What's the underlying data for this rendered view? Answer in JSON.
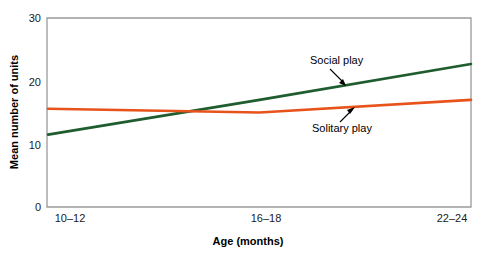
{
  "chart_data": {
    "type": "line",
    "title": "",
    "xlabel": "Age (months)",
    "ylabel": "Mean number of units",
    "categories": [
      "10–12",
      "16–18",
      "22–24"
    ],
    "x_tick_labels": [
      "10–12",
      "16–18",
      "22–24"
    ],
    "y_tick_labels": [
      "0",
      "10",
      "20",
      "30"
    ],
    "y_ticks": [
      0,
      10,
      20,
      30
    ],
    "ylim": [
      0,
      30
    ],
    "xlim": [
      0,
      2
    ],
    "grid": false,
    "legend": "annotations-on-plot",
    "series": [
      {
        "name": "Social play",
        "color": "#1F5C2E",
        "x": [
          "10–12",
          "16–18",
          "22–24"
        ],
        "values": [
          11.5,
          17.0,
          22.7
        ]
      },
      {
        "name": "Solitary play",
        "color": "#E8531B",
        "x": [
          "10–12",
          "16–18",
          "22–24"
        ],
        "values": [
          15.6,
          15.0,
          17.0
        ]
      }
    ],
    "annotations": [
      {
        "text": "Social play",
        "series": "Social play"
      },
      {
        "text": "Solitary play",
        "series": "Solitary play"
      }
    ]
  },
  "colors": {
    "social_play": "#1F5C2E",
    "solitary_play": "#E8531B",
    "axis": "#8a8a8a",
    "text": "#000000",
    "background": "#ffffff"
  },
  "axes": {
    "y_title": "Mean number of units",
    "x_title": "Age (months)",
    "y_tick_0": "0",
    "y_tick_10": "10",
    "y_tick_20": "20",
    "y_tick_30": "30",
    "x_tick_1": "10–12",
    "x_tick_2": "16–18",
    "x_tick_3": "22–24"
  },
  "annotations": {
    "social_play_label": "Social play",
    "solitary_play_label": "Solitary play"
  }
}
